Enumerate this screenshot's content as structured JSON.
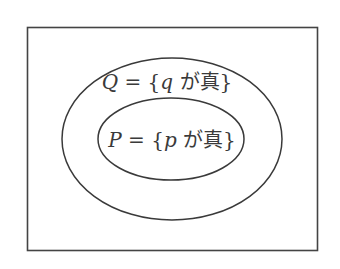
{
  "diagram": {
    "type": "venn-subset",
    "universe": {
      "label": ""
    },
    "sets": [
      {
        "id": "Q",
        "var": "Q",
        "eq": " = {",
        "elem": "q",
        "cond": " が真}",
        "role": "outer"
      },
      {
        "id": "P",
        "var": "P",
        "eq": " = {",
        "elem": "p",
        "cond": " が真}",
        "role": "inner"
      }
    ],
    "colors": {
      "stroke": "#3a3a3a",
      "background": "#ffffff"
    }
  }
}
